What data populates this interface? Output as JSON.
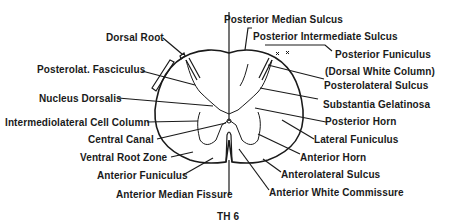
{
  "diagram": {
    "caption": "TH 6",
    "labels_left": [
      {
        "id": "dorsal_root",
        "text": "Dorsal Root"
      },
      {
        "id": "posterolat_fasciculus",
        "text": "Posterolat. Fasciculus"
      },
      {
        "id": "nucleus_dorsalis",
        "text": "Nucleus Dorsalis"
      },
      {
        "id": "intermediolateral_cell_column",
        "text": "Intermediolateral Cell Column"
      },
      {
        "id": "central_canal",
        "text": "Central Canal"
      },
      {
        "id": "ventral_root_zone",
        "text": "Ventral Root  Zone"
      },
      {
        "id": "anterior_funiculus",
        "text": "Anterior Funiculus"
      },
      {
        "id": "anterior_median_fissure",
        "text": "Anterior Median Fissure"
      }
    ],
    "labels_right": [
      {
        "id": "posterior_median_sulcus",
        "text": "Posterior Median Sulcus"
      },
      {
        "id": "posterior_intermediate_sulcus",
        "text": "Posterior Intermediate Sulcus"
      },
      {
        "id": "posterior_funiculus",
        "text": "Posterior Funiculus"
      },
      {
        "id": "dorsal_white_column",
        "text": "(Dorsal White Column)"
      },
      {
        "id": "posterolateral_sulcus",
        "text": "Posterolateral Sulcus"
      },
      {
        "id": "substantia_gelatinosa",
        "text": "Substantia Gelatinosa"
      },
      {
        "id": "posterior_horn",
        "text": "Posterior Horn"
      },
      {
        "id": "lateral_funiculus",
        "text": "Lateral Funiculus"
      },
      {
        "id": "anterior_horn",
        "text": "Anterior Horn"
      },
      {
        "id": "anterolateral_sulcus",
        "text": "Anterolateral Sulcus"
      },
      {
        "id": "anterior_white_commissure",
        "text": "Anterior White Commissure"
      }
    ],
    "colors": {
      "ink": "#1a1a1a",
      "background": "#ffffff"
    }
  }
}
